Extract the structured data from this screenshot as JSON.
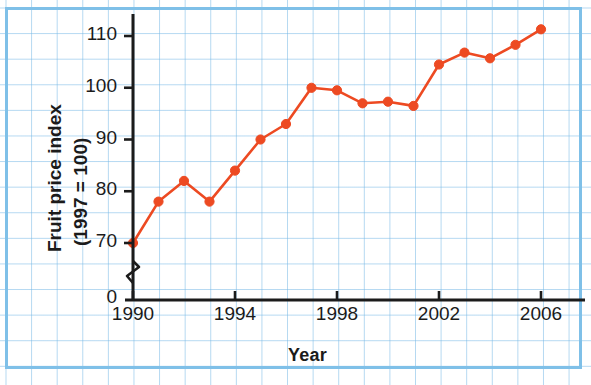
{
  "chart_data": {
    "type": "line",
    "title": "",
    "xlabel": "Year",
    "ylabel": "Fruit price index (1997 = 100)",
    "ylabel_line1": "Fruit price index",
    "ylabel_line2": "(1997 = 100)",
    "x": [
      1990,
      1991,
      1992,
      1993,
      1994,
      1995,
      1996,
      1997,
      1998,
      1999,
      2000,
      2001,
      2002,
      2003,
      2004,
      2005,
      2006
    ],
    "values": [
      70,
      78,
      82,
      78,
      84,
      90,
      93,
      100,
      99.5,
      97,
      97.3,
      96.5,
      104.5,
      106.8,
      105.7,
      108.3,
      111.3
    ],
    "xticks": [
      1990,
      1994,
      1998,
      2002,
      2006
    ],
    "xtick_labels": [
      "1990",
      "1994",
      "1998",
      "2002",
      "2006"
    ],
    "yticks": [
      70,
      80,
      90,
      100,
      110
    ],
    "ytick_labels": [
      "70",
      "80",
      "90",
      "100",
      "110"
    ],
    "y_zero_label": "0",
    "xlim": [
      1990,
      2006
    ],
    "ylim": [
      70,
      114
    ],
    "axis_break": true,
    "grid": true,
    "legend": "none",
    "series_color": "#ED4A22",
    "marker": "circle",
    "axis_color": "#1b1b1b",
    "grid_color": "#78b9e6",
    "paper_border_color": "#7fc0e8"
  }
}
